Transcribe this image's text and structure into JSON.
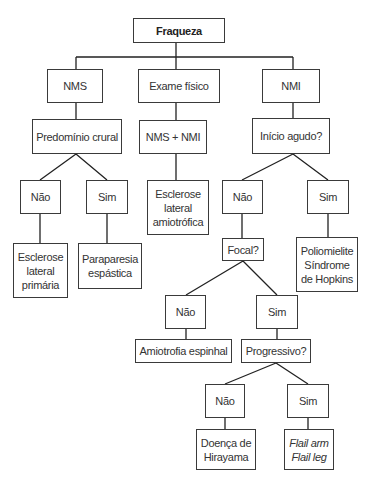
{
  "diagram": {
    "type": "flowchart",
    "title": "Fraqueza",
    "colors": {
      "line": "#222222",
      "border": "#3a3a3a",
      "text": "#333333",
      "background": "#ffffff"
    },
    "nodes": [
      {
        "id": "fraqueza",
        "label": "Fraqueza",
        "x": 133,
        "y": 18,
        "w": 92,
        "h": 25,
        "style": "root"
      },
      {
        "id": "nms",
        "label": "NMS",
        "x": 47,
        "y": 69,
        "w": 56,
        "h": 34
      },
      {
        "id": "exame",
        "label": "Exame físico",
        "x": 138,
        "y": 69,
        "w": 82,
        "h": 34
      },
      {
        "id": "nmi",
        "label": "NMI",
        "x": 262,
        "y": 69,
        "w": 58,
        "h": 34
      },
      {
        "id": "predominio",
        "label": "Predomínio crural",
        "x": 32,
        "y": 119,
        "w": 90,
        "h": 35
      },
      {
        "id": "nms_nmi",
        "label": "NMS + NMI",
        "x": 139,
        "y": 120,
        "w": 68,
        "h": 34
      },
      {
        "id": "inicio",
        "label": "Início agudo?",
        "x": 252,
        "y": 118,
        "w": 78,
        "h": 36
      },
      {
        "id": "nao1",
        "label": "Não",
        "x": 20,
        "y": 180,
        "w": 41,
        "h": 34
      },
      {
        "id": "sim1",
        "label": "Sim",
        "x": 86,
        "y": 180,
        "w": 42,
        "h": 34
      },
      {
        "id": "ela",
        "label": "Esclerose\nlateral\namiotrófica",
        "x": 147,
        "y": 180,
        "w": 62,
        "h": 55
      },
      {
        "id": "nao2",
        "label": "Não",
        "x": 222,
        "y": 180,
        "w": 41,
        "h": 34
      },
      {
        "id": "sim2",
        "label": "Sim",
        "x": 307,
        "y": 180,
        "w": 42,
        "h": 34
      },
      {
        "id": "elp",
        "label": "Esclerose\nlateral\nprimária",
        "x": 13,
        "y": 243,
        "w": 55,
        "h": 55
      },
      {
        "id": "paraparesia",
        "label": "Paraparesia\nespástica",
        "x": 78,
        "y": 243,
        "w": 64,
        "h": 46
      },
      {
        "id": "focal",
        "label": "Focal?",
        "x": 222,
        "y": 238,
        "w": 42,
        "h": 23
      },
      {
        "id": "polio",
        "label": "Poliomielite\nSíndrome\nde Hopkins",
        "x": 296,
        "y": 237,
        "w": 62,
        "h": 55
      },
      {
        "id": "nao3",
        "label": "Não",
        "x": 165,
        "y": 295,
        "w": 41,
        "h": 34
      },
      {
        "id": "sim3",
        "label": "Sim",
        "x": 256,
        "y": 295,
        "w": 42,
        "h": 34
      },
      {
        "id": "amiotrofia",
        "label": "Amiotrofia espinhal",
        "x": 135,
        "y": 339,
        "w": 97,
        "h": 24
      },
      {
        "id": "progressivo",
        "label": "Progressivo?",
        "x": 241,
        "y": 339,
        "w": 70,
        "h": 24
      },
      {
        "id": "nao4",
        "label": "Não",
        "x": 205,
        "y": 384,
        "w": 40,
        "h": 34
      },
      {
        "id": "sim4",
        "label": "Sim",
        "x": 287,
        "y": 384,
        "w": 42,
        "h": 34
      },
      {
        "id": "hirayama",
        "label": "Doença de\nHirayama",
        "x": 196,
        "y": 429,
        "w": 60,
        "h": 41
      },
      {
        "id": "flail",
        "label": "Flail arm\nFlail leg",
        "x": 284,
        "y": 429,
        "w": 50,
        "h": 41,
        "style": "italic"
      }
    ],
    "edges": [
      {
        "from": "fraqueza",
        "to": "nms"
      },
      {
        "from": "fraqueza",
        "to": "exame"
      },
      {
        "from": "fraqueza",
        "to": "nmi"
      },
      {
        "from": "nms",
        "to": "predominio"
      },
      {
        "from": "exame",
        "to": "nms_nmi"
      },
      {
        "from": "nmi",
        "to": "inicio"
      },
      {
        "from": "predominio",
        "to": "nao1"
      },
      {
        "from": "predominio",
        "to": "sim1"
      },
      {
        "from": "nms_nmi",
        "to": "ela"
      },
      {
        "from": "inicio",
        "to": "nao2"
      },
      {
        "from": "inicio",
        "to": "sim2"
      },
      {
        "from": "nao1",
        "to": "elp"
      },
      {
        "from": "sim1",
        "to": "paraparesia"
      },
      {
        "from": "nao2",
        "to": "focal"
      },
      {
        "from": "sim2",
        "to": "polio"
      },
      {
        "from": "focal",
        "to": "nao3"
      },
      {
        "from": "focal",
        "to": "sim3"
      },
      {
        "from": "nao3",
        "to": "amiotrofia"
      },
      {
        "from": "sim3",
        "to": "progressivo"
      },
      {
        "from": "progressivo",
        "to": "nao4"
      },
      {
        "from": "progressivo",
        "to": "sim4"
      },
      {
        "from": "nao4",
        "to": "hirayama"
      },
      {
        "from": "sim4",
        "to": "flail"
      }
    ]
  },
  "lines": {
    "bus": "M176,43 V57 M76,57 H293 M76,57 V69 M176,57 V69 M293,57 V69",
    "vertical": "M76,103 V119 M176,103 V120 M293,103 V118 M176,154 V180 M40,214 V243 M107,214 V243 M242,214 V238 M328,214 V237 M186,329 V339 M277,329 V339 M225,418 V429 M308,418 V429",
    "diagonal": "M76,154 L40,180 M76,154 L107,180 M293,154 L242,180 M293,154 L328,180 M243,261 L186,295 M243,261 L277,295 M276,363 L225,384 M276,363 L308,384"
  }
}
